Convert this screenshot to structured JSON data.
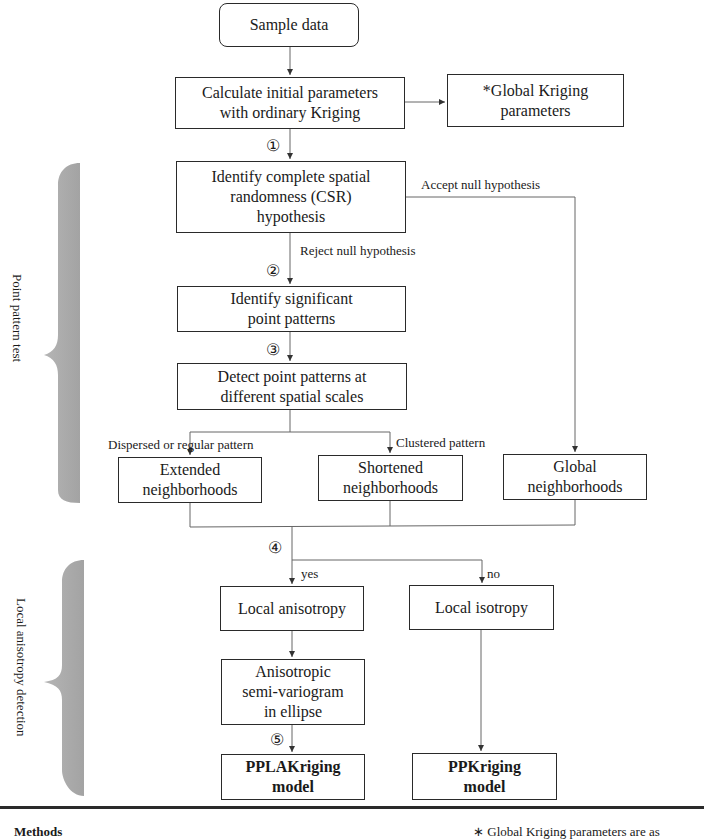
{
  "nodes": {
    "sample_data": "Sample data",
    "calc_initial": [
      "Calculate initial parameters",
      "with ordinary Kriging"
    ],
    "global_params": [
      "*Global Kriging",
      "parameters"
    ],
    "csr": [
      "Identify complete spatial",
      "randomness (CSR)",
      "hypothesis"
    ],
    "identify_sig": [
      "Identify significant",
      "point patterns"
    ],
    "detect": [
      "Detect point patterns at",
      "different spatial scales"
    ],
    "extended": [
      "Extended",
      "neighborhoods"
    ],
    "shortened": [
      "Shortened",
      "neighborhoods"
    ],
    "global_nb": [
      "Global",
      "neighborhoods"
    ],
    "local_aniso": "Local anisotropy",
    "local_iso": "Local isotropy",
    "aniso_semivar": [
      "Anisotropic",
      "semi-variogram",
      "in ellipse"
    ],
    "pplakriging": [
      "PPLAKriging",
      "model"
    ],
    "ppkriging": [
      "PPKriging",
      "model"
    ]
  },
  "edge_labels": {
    "accept": "Accept null hypothesis",
    "reject": "Reject null hypothesis",
    "dispersed": "Dispersed or regular pattern",
    "clustered": "Clustered pattern",
    "yes": "yes",
    "no": "no"
  },
  "steps": [
    "①",
    "②",
    "③",
    "④",
    "⑤"
  ],
  "brackets": {
    "point_pattern": "Point pattern test",
    "local_aniso": "Local anisotropy detection"
  },
  "footer": {
    "methods": "Methods",
    "note": "∗  Global Kriging parameters are as"
  },
  "colors": {
    "line": "#2a2a2a",
    "bracket": "#a9a9a9",
    "connector": "#777777"
  }
}
